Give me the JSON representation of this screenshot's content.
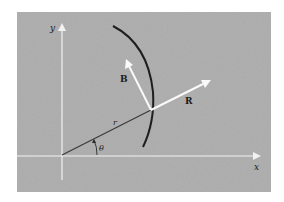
{
  "diagram": {
    "colors": {
      "page_background": "#ffffff",
      "panel_background": "#a9a9a9",
      "axis_color": "#f2f2f2",
      "vector_color": "#fafafa",
      "curve_color": "#1e1e1e",
      "radius_line_color": "#3a3a3a",
      "label_color": "#1a1a1a"
    },
    "axes": {
      "x_label": "x",
      "y_label": "y"
    },
    "curve": {
      "description": "curved path (orbit) concave toward origin"
    },
    "radius": {
      "label": "r",
      "angle_label": "θ"
    },
    "vectors": [
      {
        "id": "B",
        "label": "B",
        "direction": "up-left from point on curve"
      },
      {
        "id": "R",
        "label": "R",
        "direction": "outward along r from point on curve"
      }
    ]
  }
}
